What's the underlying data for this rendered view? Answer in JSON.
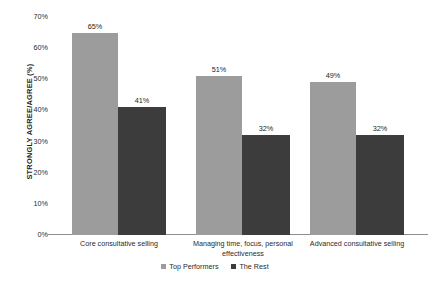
{
  "chart_data": {
    "type": "bar",
    "title": "",
    "subtitle": "",
    "xlabel": "",
    "ylabel": "STRONGLY AGREE/AGREE (%)",
    "ylim": [
      0,
      70
    ],
    "ytick_labels": [
      "70%",
      "60%",
      "50%",
      "40%",
      "30%",
      "20%",
      "10%",
      "0%"
    ],
    "ytick_values": [
      70,
      60,
      50,
      40,
      30,
      20,
      10,
      0
    ],
    "grid": false,
    "legend_position": "bottom-center",
    "categories": [
      "Core consultative selling",
      "Managing time, focus, personal effectiveness",
      "Advanced consultative selling"
    ],
    "series": [
      {
        "name": "Top Performers",
        "color": "#9c9c9c",
        "values": [
          65,
          51,
          49
        ],
        "value_labels": [
          "65%",
          "51%",
          "49%"
        ]
      },
      {
        "name": "The Rest",
        "color": "#3c3c3c",
        "values": [
          41,
          32,
          32
        ],
        "value_labels": [
          "41%",
          "32%",
          "32%"
        ]
      }
    ]
  },
  "axis": {
    "y_title": "STRONGLY AGREE/AGREE (%)",
    "ticks": [
      {
        "label": "70%"
      },
      {
        "label": "60%"
      },
      {
        "label": "50%"
      },
      {
        "label": "40%"
      },
      {
        "label": "30%"
      },
      {
        "label": "20%"
      },
      {
        "label": "10%"
      },
      {
        "label": "0%"
      }
    ]
  },
  "categories": [
    {
      "label": "Core consultative selling"
    },
    {
      "label": "Managing time, focus, personal effectiveness"
    },
    {
      "label": "Advanced consultative selling"
    }
  ],
  "legend": {
    "items": [
      {
        "label": "Top Performers",
        "color": "#9c9c9c"
      },
      {
        "label": "The Rest",
        "color": "#3c3c3c"
      }
    ]
  },
  "bar_labels": {
    "g0s0": "65%",
    "g0s1": "41%",
    "g1s0": "51%",
    "g1s1": "32%",
    "g2s0": "49%",
    "g2s1": "32%"
  }
}
